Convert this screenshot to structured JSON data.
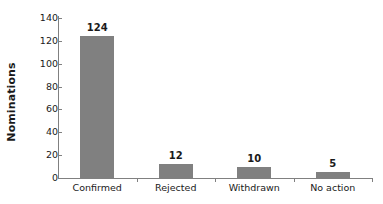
{
  "chart_data": {
    "type": "bar",
    "title": "",
    "subtitle": "",
    "xlabel": "",
    "ylabel": "Nominations",
    "categories": [
      "Confirmed",
      "Rejected",
      "Withdrawn",
      "No action"
    ],
    "values": [
      124,
      12,
      10,
      5
    ],
    "data_labels": [
      "124",
      "12",
      "10",
      "5"
    ],
    "ylim": [
      0,
      140
    ],
    "ytick_labels": [
      "0",
      "20",
      "40",
      "60",
      "80",
      "100",
      "120",
      "140"
    ],
    "ytick_values": [
      0,
      20,
      40,
      60,
      80,
      100,
      120,
      140
    ],
    "grid": false,
    "legend": false,
    "legend_position": "none",
    "bar_color": "#808080",
    "axis_color": "#808080",
    "text_color": "#1a1a1a",
    "background_color": "#ffffff"
  }
}
